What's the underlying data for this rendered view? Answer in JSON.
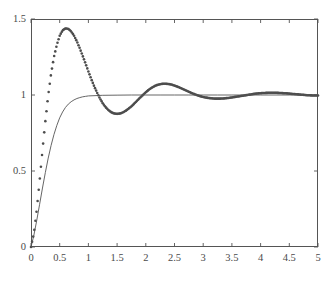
{
  "figure": {
    "background_color": "#ffffff",
    "axes_color": "#555555",
    "text_color": "#4a4a4a"
  },
  "chart_data": {
    "type": "line",
    "title": "",
    "subtitle": "",
    "xlabel": "",
    "ylabel": "",
    "xlim": [
      0,
      5
    ],
    "ylim": [
      0,
      1.5
    ],
    "grid": false,
    "legend": null,
    "legend_position": "none",
    "xticks": [
      0,
      0.5,
      1,
      1.5,
      2,
      2.5,
      3,
      3.5,
      4,
      4.5,
      5
    ],
    "xtick_labels": [
      "0",
      "0.5",
      "1",
      "1.5",
      "2",
      "2.5",
      "3",
      "3.5",
      "4",
      "4.5",
      "5"
    ],
    "yticks": [
      0,
      0.5,
      1,
      1.5
    ],
    "ytick_labels": [
      "0",
      "0.5",
      "1",
      "1.5"
    ],
    "annotations": [],
    "series": [
      {
        "name": "underdamped step response",
        "style": "markers",
        "marker": "dot",
        "marker_size": 2.6,
        "color": "#4d4d4d",
        "linewidth": 0,
        "x": [
          0,
          0.05,
          0.1,
          0.15,
          0.2,
          0.25,
          0.3,
          0.35,
          0.4,
          0.45,
          0.5,
          0.55,
          0.6,
          0.65,
          0.7,
          0.75,
          0.8,
          0.85,
          0.9,
          0.95,
          1,
          1.05,
          1.1,
          1.15,
          1.2,
          1.25,
          1.3,
          1.35,
          1.4,
          1.45,
          1.5,
          1.55,
          1.6,
          1.65,
          1.7,
          1.75,
          1.8,
          1.85,
          1.9,
          1.95,
          2,
          2.05,
          2.1,
          2.15,
          2.2,
          2.25,
          2.3,
          2.35,
          2.4,
          2.45,
          2.5,
          2.55,
          2.6,
          2.65,
          2.7,
          2.75,
          2.8,
          2.85,
          2.9,
          2.95,
          3,
          3.05,
          3.1,
          3.15,
          3.2,
          3.25,
          3.3,
          3.35,
          3.4,
          3.45,
          3.5,
          3.55,
          3.6,
          3.65,
          3.7,
          3.75,
          3.8,
          3.85,
          3.9,
          3.95,
          4,
          4.05,
          4.1,
          4.15,
          4.2,
          4.25,
          4.3,
          4.35,
          4.4,
          4.45,
          4.5,
          4.55,
          4.6,
          4.65,
          4.7,
          4.75,
          4.8,
          4.85,
          4.9,
          4.95,
          5
        ],
        "y": [
          0,
          0.089,
          0.244,
          0.435,
          0.636,
          0.828,
          0.998,
          1.14,
          1.25,
          1.33,
          1.39,
          1.425,
          1.438,
          1.435,
          1.418,
          1.39,
          1.352,
          1.307,
          1.258,
          1.207,
          1.155,
          1.105,
          1.058,
          1.016,
          0.978,
          0.946,
          0.92,
          0.9,
          0.886,
          0.878,
          0.876,
          0.878,
          0.885,
          0.896,
          0.91,
          0.926,
          0.944,
          0.963,
          0.982,
          1.0,
          1.018,
          1.034,
          1.047,
          1.058,
          1.066,
          1.071,
          1.074,
          1.074,
          1.072,
          1.068,
          1.062,
          1.055,
          1.047,
          1.039,
          1.03,
          1.021,
          1.013,
          1.005,
          0.998,
          0.992,
          0.987,
          0.983,
          0.98,
          0.978,
          0.976,
          0.976,
          0.976,
          0.977,
          0.979,
          0.981,
          0.984,
          0.987,
          0.99,
          0.993,
          0.996,
          0.999,
          1.002,
          1.005,
          1.008,
          1.01,
          1.012,
          1.013,
          1.014,
          1.015,
          1.015,
          1.015,
          1.014,
          1.013,
          1.012,
          1.011,
          1.009,
          1.007,
          1.006,
          1.004,
          1.002,
          1.001,
          0.999,
          0.998,
          0.997,
          0.997,
          0.997
        ]
      },
      {
        "name": "reference step response",
        "style": "line",
        "marker": "none",
        "marker_size": 0,
        "color": "#555555",
        "linewidth": 0.9,
        "x": [
          0,
          0.05,
          0.1,
          0.15,
          0.2,
          0.25,
          0.3,
          0.35,
          0.4,
          0.45,
          0.5,
          0.55,
          0.6,
          0.65,
          0.7,
          0.75,
          0.8,
          0.85,
          0.9,
          0.95,
          1,
          1.25,
          1.5,
          1.75,
          2,
          2.25,
          2.5,
          2.75,
          3,
          3.25,
          3.5,
          3.75,
          4,
          4.25,
          4.5,
          4.75,
          5
        ],
        "y": [
          0,
          0.077,
          0.175,
          0.281,
          0.388,
          0.49,
          0.585,
          0.668,
          0.74,
          0.8,
          0.85,
          0.888,
          0.918,
          0.94,
          0.956,
          0.968,
          0.977,
          0.983,
          0.988,
          0.991,
          0.994,
          0.998,
          0.999,
          1.0,
          1.0,
          1.0,
          1.0,
          1.0,
          1.0,
          1.0,
          1.0,
          1.0,
          1.0,
          1.0,
          1.0,
          1.0,
          1.0
        ]
      }
    ]
  },
  "axes_geometry": {
    "left": 31,
    "right": 318,
    "top": 19,
    "bottom": 247,
    "tick_length": 4
  }
}
